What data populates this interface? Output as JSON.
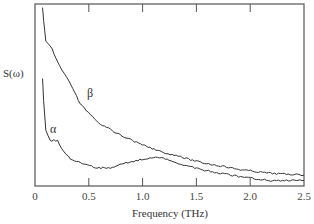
{
  "chart_data": {
    "type": "line",
    "title": "",
    "xlabel": "Frequency (THz)",
    "ylabel": "S(ω)",
    "xlim": [
      0,
      2.5
    ],
    "ylim": [
      0,
      1
    ],
    "x_ticks": [
      "0",
      "0.5",
      "1.0",
      "1.5",
      "2.0",
      "2.5"
    ],
    "x_tick_values": [
      0,
      0.5,
      1.0,
      1.5,
      2.0,
      2.5
    ],
    "y_ticks": [],
    "grid": false,
    "legend": "inline labels",
    "series": [
      {
        "name": "β",
        "x": [
          0.07,
          0.08,
          0.1,
          0.16,
          0.23,
          0.35,
          0.42,
          0.61,
          0.79,
          0.98,
          1.16,
          1.54,
          1.91,
          2.19,
          2.5
        ],
        "values": [
          0.98,
          0.91,
          0.8,
          0.75,
          0.66,
          0.54,
          0.45,
          0.34,
          0.28,
          0.23,
          0.19,
          0.13,
          0.09,
          0.07,
          0.06
        ],
        "label_position": [
          0.52,
          0.48
        ]
      },
      {
        "name": "α",
        "x": [
          0.07,
          0.08,
          0.1,
          0.14,
          0.21,
          0.25,
          0.33,
          0.42,
          0.56,
          0.7,
          0.79,
          1.03,
          1.14,
          1.3,
          1.54,
          1.91,
          2.19,
          2.5
        ],
        "values": [
          0.59,
          0.47,
          0.31,
          0.25,
          0.25,
          0.2,
          0.15,
          0.13,
          0.1,
          0.1,
          0.12,
          0.15,
          0.16,
          0.13,
          0.09,
          0.05,
          0.03,
          0.03
        ],
        "label_position": [
          0.12,
          0.3
        ]
      }
    ],
    "units": "relative (arbitrary)"
  },
  "labels": {
    "ylabel": "S(ω)",
    "xlabel": "Frequency (THz)",
    "beta": "β",
    "alpha": "α"
  }
}
